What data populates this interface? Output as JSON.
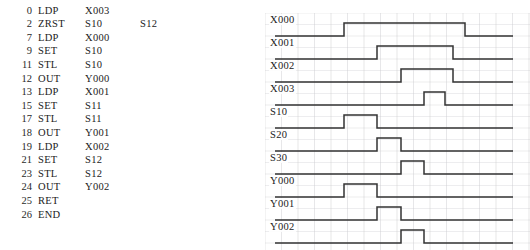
{
  "program": {
    "columns": [
      "step",
      "instruction",
      "operand1",
      "operand2"
    ],
    "rows": [
      {
        "step": "0",
        "instruction": "LDP",
        "operand1": "X003",
        "operand2": ""
      },
      {
        "step": "2",
        "instruction": "ZRST",
        "operand1": "S10",
        "operand2": "S12"
      },
      {
        "step": "7",
        "instruction": "LDP",
        "operand1": "X000",
        "operand2": ""
      },
      {
        "step": "9",
        "instruction": "SET",
        "operand1": "S10",
        "operand2": ""
      },
      {
        "step": "11",
        "instruction": "STL",
        "operand1": "S10",
        "operand2": ""
      },
      {
        "step": "12",
        "instruction": "OUT",
        "operand1": "Y000",
        "operand2": ""
      },
      {
        "step": "13",
        "instruction": "LDP",
        "operand1": "X001",
        "operand2": ""
      },
      {
        "step": "15",
        "instruction": "SET",
        "operand1": "S11",
        "operand2": ""
      },
      {
        "step": "17",
        "instruction": "STL",
        "operand1": "S11",
        "operand2": ""
      },
      {
        "step": "18",
        "instruction": "OUT",
        "operand1": "Y001",
        "operand2": ""
      },
      {
        "step": "19",
        "instruction": "LDP",
        "operand1": "X002",
        "operand2": ""
      },
      {
        "step": "21",
        "instruction": "SET",
        "operand1": "S12",
        "operand2": ""
      },
      {
        "step": "23",
        "instruction": "STL",
        "operand1": "S12",
        "operand2": ""
      },
      {
        "step": "24",
        "instruction": "OUT",
        "operand1": "Y002",
        "operand2": ""
      },
      {
        "step": "25",
        "instruction": "RET",
        "operand1": "",
        "operand2": ""
      },
      {
        "step": "26",
        "instruction": "END",
        "operand1": "",
        "operand2": ""
      }
    ]
  },
  "timing": {
    "grid": {
      "left": 0,
      "top": 13,
      "width": 265,
      "height": 237,
      "column_spacing": 16.5,
      "row_spacing": 11.5,
      "line_color": "#c9c9cf"
    },
    "wave_color": "#333333",
    "wave_x_start": 10,
    "wave_x_end": 248,
    "signals": [
      {
        "label": "X000",
        "baseline_y": 36,
        "high_y": 23,
        "label_x": 4,
        "label_y": 23,
        "pulses": [
          {
            "rise": 79,
            "fall": 200
          }
        ]
      },
      {
        "label": "X001",
        "baseline_y": 59,
        "high_y": 46,
        "label_x": 4,
        "label_y": 46,
        "pulses": [
          {
            "rise": 112,
            "fall": 188
          }
        ]
      },
      {
        "label": "X002",
        "baseline_y": 82,
        "high_y": 69,
        "label_x": 4,
        "label_y": 69,
        "pulses": [
          {
            "rise": 136,
            "fall": 188
          }
        ]
      },
      {
        "label": "X003",
        "baseline_y": 105,
        "high_y": 92,
        "label_x": 4,
        "label_y": 92,
        "pulses": [
          {
            "rise": 159,
            "fall": 180
          }
        ]
      },
      {
        "label": "S10",
        "baseline_y": 128,
        "high_y": 115,
        "label_x": 4,
        "label_y": 115,
        "pulses": [
          {
            "rise": 79,
            "fall": 112
          }
        ]
      },
      {
        "label": "S20",
        "baseline_y": 151,
        "high_y": 138,
        "label_x": 4,
        "label_y": 138,
        "pulses": [
          {
            "rise": 112,
            "fall": 136
          }
        ]
      },
      {
        "label": "S30",
        "baseline_y": 174,
        "high_y": 161,
        "label_x": 4,
        "label_y": 161,
        "pulses": [
          {
            "rise": 136,
            "fall": 159
          }
        ]
      },
      {
        "label": "Y000",
        "baseline_y": 197,
        "high_y": 184,
        "label_x": 4,
        "label_y": 184,
        "pulses": [
          {
            "rise": 79,
            "fall": 112
          }
        ]
      },
      {
        "label": "Y001",
        "baseline_y": 220,
        "high_y": 207,
        "label_x": 4,
        "label_y": 207,
        "pulses": [
          {
            "rise": 112,
            "fall": 136
          }
        ]
      },
      {
        "label": "Y002",
        "baseline_y": 243,
        "high_y": 230,
        "label_x": 4,
        "label_y": 230,
        "pulses": [
          {
            "rise": 136,
            "fall": 159
          }
        ]
      }
    ]
  }
}
